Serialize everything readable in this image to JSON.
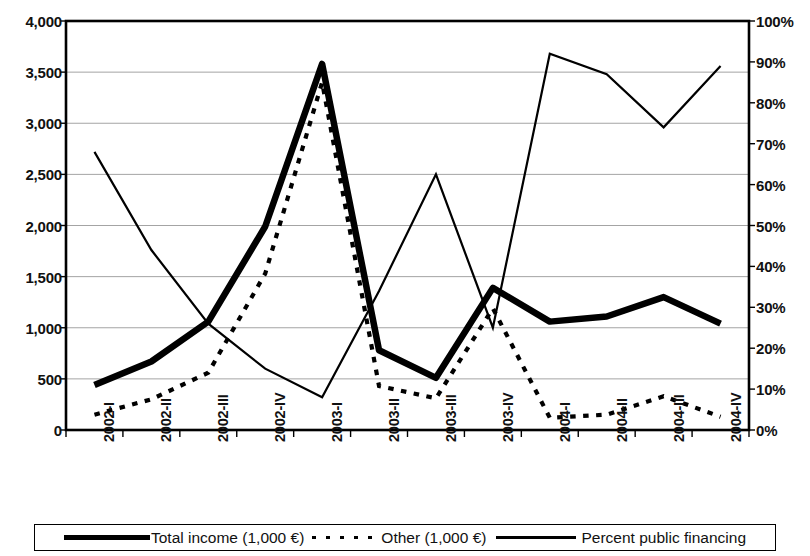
{
  "chart_data": {
    "type": "line",
    "title": "",
    "subtitle": "",
    "xlabel": "",
    "ylabel": "",
    "y2label": "",
    "grid": true,
    "legend_position": "bottom",
    "categories": [
      "2002-I",
      "2002-II",
      "2002-III",
      "2002-IV",
      "2003-I",
      "2003-II",
      "2003-III",
      "2003-IV",
      "2004-I",
      "2004-II",
      "2004-III",
      "2004-IV"
    ],
    "y_left": {
      "min": 0,
      "max": 4000,
      "ticks": [
        0,
        500,
        1000,
        1500,
        2000,
        2500,
        3000,
        3500,
        4000
      ],
      "tick_labels": [
        "0",
        "500",
        "1,000",
        "1,500",
        "2,000",
        "2,500",
        "3,000",
        "3,500",
        "4,000"
      ]
    },
    "y_right": {
      "min": 0,
      "max": 100,
      "ticks": [
        0,
        10,
        20,
        30,
        40,
        50,
        60,
        70,
        80,
        90,
        100
      ],
      "tick_labels": [
        "0%",
        "10%",
        "20%",
        "30%",
        "40%",
        "50%",
        "60%",
        "70%",
        "80%",
        "90%",
        "100%"
      ]
    },
    "series": [
      {
        "name": "Total income  (1,000 €)",
        "axis": "left",
        "style": "thick-solid",
        "color": "#000000",
        "values": [
          440,
          670,
          1060,
          1990,
          3580,
          780,
          510,
          1390,
          1060,
          1110,
          1300,
          1040
        ]
      },
      {
        "name": "Other (1,000 €)",
        "axis": "left",
        "style": "dotted",
        "color": "#000000",
        "values": [
          150,
          300,
          560,
          1530,
          3400,
          430,
          310,
          1190,
          120,
          150,
          330,
          130
        ]
      },
      {
        "name": "Percent public financing",
        "axis": "right",
        "style": "thin-solid",
        "color": "#000000",
        "values": [
          68,
          44,
          26,
          15,
          8,
          34,
          62.5,
          25,
          92,
          87,
          74,
          89
        ]
      }
    ]
  },
  "legend": {
    "items": [
      {
        "label": "Total income  (1,000 €)",
        "swatch": "thick-solid-line-icon"
      },
      {
        "label": "Other (1,000 €)",
        "swatch": "dotted-line-icon"
      },
      {
        "label": "Percent public financing",
        "swatch": "thin-solid-line-icon"
      }
    ]
  }
}
